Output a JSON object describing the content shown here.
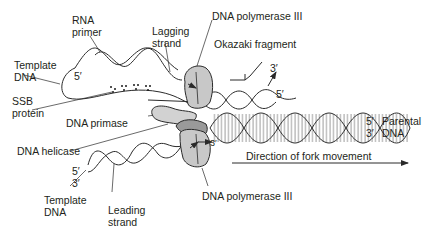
{
  "colors": {
    "strand": "#2a2a2a",
    "polymerase_fill": "#c8c8c8",
    "helicase_fill": "#9a9a9a",
    "primase_fill": "#d2d2d2",
    "text": "#231f20"
  },
  "labels": {
    "rna_primer": [
      "RNA",
      "primer"
    ],
    "lagging_strand": [
      "Lagging",
      "strand"
    ],
    "dna_pol_top": "DNA polymerase III",
    "okazaki": "Okazaki fragment",
    "template_dna_top": [
      "Template",
      "DNA"
    ],
    "ssb_protein": [
      "SSB",
      "protein"
    ],
    "dna_primase": "DNA primase",
    "dna_helicase": "DNA helicase",
    "parental_dna": [
      "Parental",
      "DNA"
    ],
    "direction": "Direction of fork movement",
    "template_dna_bottom": [
      "Template",
      "DNA"
    ],
    "leading_strand": [
      "Leading",
      "strand"
    ],
    "dna_pol_bottom": "DNA polymerase III"
  },
  "ends": {
    "top_template_5": "5′",
    "okazaki_3": "3′",
    "okazaki_5": "5′",
    "parental_5": "5′",
    "parental_3": "3′",
    "leading_3_inner": "3′",
    "bottom_5": "5′",
    "bottom_3": "3′"
  }
}
